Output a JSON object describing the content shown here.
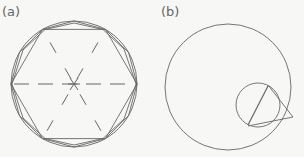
{
  "panels": [
    {
      "label": "(a)",
      "description": "Circle with inscribed regular hexagon and dodecagon; dashed radial lines from center",
      "circle": {
        "cx": 74,
        "cy": 84,
        "r": 63
      },
      "hexagon_vertices": 6,
      "dodecagon_vertices": 12
    },
    {
      "label": "(b)",
      "description": "Large circle with smaller interior circle; two tangent lines from a point on the large circle to the small circle, with chord joining tangent points",
      "outer_circle": {
        "cx": 228,
        "cy": 87,
        "r": 63
      },
      "inner_circle": {
        "cx": 256,
        "cy": 105,
        "r": 22
      },
      "external_point": {
        "x": 293,
        "y": 118
      }
    }
  ],
  "colors": {
    "stroke": "#666666",
    "background": "#f7f7f5"
  }
}
